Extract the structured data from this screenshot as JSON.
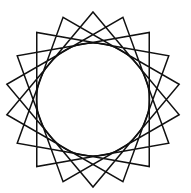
{
  "figure": {
    "width": 191,
    "height": 193,
    "background": "#ffffff",
    "stroke_color": "#111111",
    "stroke_width": 1.5,
    "star_polygon": {
      "name": "18-point star polygon {18/5}",
      "points": 18,
      "step": 5,
      "center": [
        93,
        99.5
      ],
      "radius": 87.5,
      "start_angle_deg": -90
    },
    "inscribed_circle": {
      "center": [
        93,
        99.5
      ],
      "radius": 56.5
    }
  }
}
